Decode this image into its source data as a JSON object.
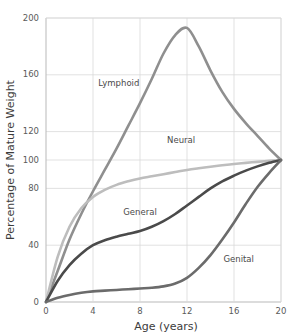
{
  "chart_data": {
    "type": "line",
    "title": "",
    "xlabel": "Age (years)",
    "ylabel": "Percentage of Mature Weight",
    "xlim": [
      0,
      20
    ],
    "ylim": [
      0,
      200
    ],
    "xticks": [
      "0",
      "4",
      "8",
      "12",
      "16",
      "20"
    ],
    "xtick_values": [
      0,
      4,
      8,
      12,
      16,
      20
    ],
    "yticks": [
      "0",
      "40",
      "80",
      "100",
      "120",
      "160",
      "200"
    ],
    "ytick_values": [
      0,
      40,
      80,
      100,
      120,
      160,
      200
    ],
    "grid": true,
    "legend_position": "inline-annotations",
    "x": [
      0,
      1,
      2,
      3,
      4,
      5,
      6,
      7,
      8,
      9,
      10,
      11,
      12,
      13,
      14,
      15,
      16,
      17,
      18,
      19,
      20
    ],
    "series": [
      {
        "name": "Lymphoid",
        "color": "#8f8f8f",
        "values": [
          0,
          22,
          44,
          62,
          78,
          93,
          108,
          124,
          140,
          157,
          175,
          188,
          193,
          180,
          163,
          148,
          136,
          126,
          117,
          108,
          100
        ],
        "label_x": 6.2,
        "label_y": 152
      },
      {
        "name": "Neural",
        "color": "#bdbdbd",
        "values": [
          0,
          32,
          53,
          66,
          74,
          79,
          82.5,
          85,
          87,
          88.5,
          90,
          91.5,
          93,
          94.2,
          95.3,
          96.3,
          97.2,
          98,
          98.7,
          99.4,
          100
        ],
        "label_x": 11.5,
        "label_y": 112
      },
      {
        "name": "General",
        "color": "#4a4a4a",
        "values": [
          0,
          15,
          26,
          34,
          40,
          43.5,
          46,
          48,
          50,
          53,
          57,
          62,
          68,
          74,
          80,
          85,
          89,
          92.5,
          95.5,
          98,
          100
        ],
        "label_x": 8.0,
        "label_y": 61
      },
      {
        "name": "Genital",
        "color": "#6b6b6b",
        "values": [
          0,
          3,
          5,
          6.5,
          7.5,
          8,
          8.5,
          9,
          9.5,
          10,
          11,
          13,
          17,
          24,
          33,
          44,
          56,
          69,
          81,
          91,
          100
        ],
        "label_x": 16.4,
        "label_y": 28
      }
    ]
  },
  "axes": {
    "ylabel": "Percentage of Mature Weight",
    "xlabel": "Age (years)"
  }
}
